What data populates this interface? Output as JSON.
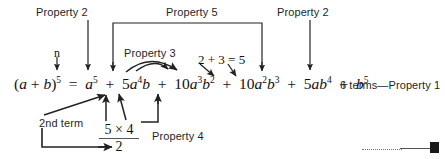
{
  "diagram": {
    "title_text": "Binomial expansion annotated with properties",
    "equation": {
      "lhs": "(a + b)",
      "lhs_exponent": "5",
      "equals": "=",
      "terms": [
        {
          "coefficient": "",
          "base": "a",
          "exp_a": "5",
          "b": "",
          "exp_b": ""
        },
        {
          "coefficient": "5",
          "base": "a",
          "exp_a": "4",
          "b": "b",
          "exp_b": ""
        },
        {
          "coefficient": "10",
          "base": "a",
          "exp_a": "3",
          "b": "b",
          "exp_b": "2"
        },
        {
          "coefficient": "10",
          "base": "a",
          "exp_a": "2",
          "b": "b",
          "exp_b": "3"
        },
        {
          "coefficient": "5",
          "base": "a",
          "exp_a": "",
          "b": "b",
          "exp_b": "4"
        },
        {
          "coefficient": "",
          "base": "",
          "exp_a": "",
          "b": "b",
          "exp_b": "5"
        }
      ],
      "plus": "+",
      "full_text": "(a + b)5 = a5 + 5a4b + 10a3b2 + 10a2b3 + 5ab4 + b5"
    },
    "labels": {
      "property2_left": "Property 2",
      "property5": "Property 5",
      "property2_right": "Property 2",
      "property3": "Property 3",
      "property4": "Property 4",
      "property1": "6 terms—Property 1",
      "n_label": "n",
      "second_term": "2nd term",
      "sum_check": "2 + 3 = 5"
    },
    "fraction": {
      "numerator": "5 × 4",
      "denominator": "2"
    },
    "colors": {
      "ink": "#111111",
      "rule": "#555555",
      "background": "#ffffff"
    }
  }
}
